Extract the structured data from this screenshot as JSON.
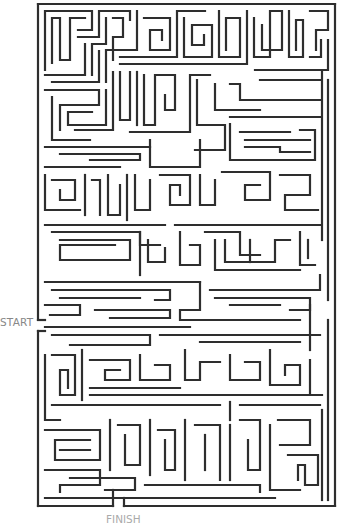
{
  "puzzle": {
    "type": "maze",
    "start_label": "START",
    "finish_label": "FINISH",
    "line_color": "#2e2e2e",
    "background": "#ffffff",
    "label_color": "#888888",
    "border": {
      "left": 38,
      "top": 4,
      "right": 335,
      "bottom": 506
    },
    "entrance": {
      "side": "left",
      "y_from": 320,
      "y_to": 331
    },
    "exit": {
      "side": "bottom",
      "x_from": 113,
      "x_to": 124
    }
  }
}
